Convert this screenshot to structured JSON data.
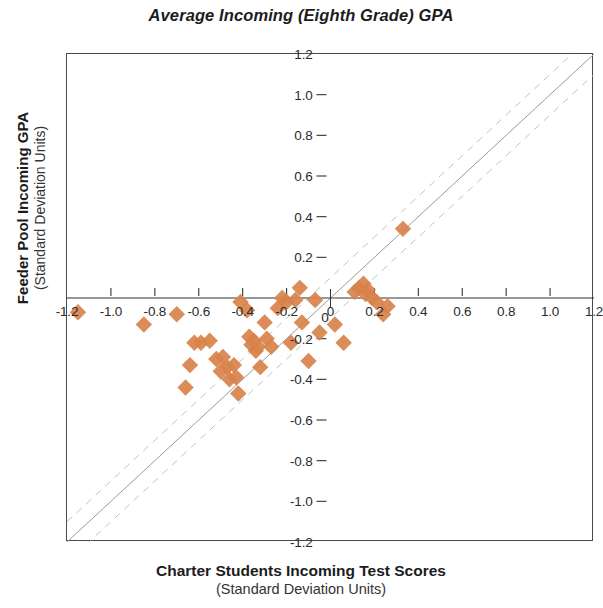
{
  "title": "Average Incoming (Eighth Grade) GPA",
  "axes": {
    "y_label_main": "Feeder Pool Incoming GPA",
    "y_label_sub": "(Standard Deviation Units)",
    "x_label_main": "Charter Students Incoming Test Scores",
    "x_label_sub": "(Standard Deviation Units)"
  },
  "style": {
    "marker_color": "#d8824a",
    "frame_color": "#4a4a4a",
    "reference_line_color": "#9a9a9a",
    "band_line_color": "#c2c2c2"
  },
  "chart_data": {
    "type": "scatter",
    "title": "Average Incoming (Eighth Grade) GPA",
    "xlabel": "Charter Students Incoming Test Scores (Standard Deviation Units)",
    "ylabel": "Feeder Pool Incoming GPA (Standard Deviation Units)",
    "xlim": [
      -1.2,
      1.2
    ],
    "ylim": [
      -1.2,
      1.2
    ],
    "xticks": [
      -1.2,
      -1.0,
      -0.8,
      -0.6,
      -0.4,
      -0.2,
      0,
      0.2,
      0.4,
      0.6,
      0.8,
      1.0,
      1.2
    ],
    "xtick_labels": [
      "-1.2",
      "-1.0",
      "-0.8",
      "-0.6",
      "-0.4",
      "-0.2",
      "0",
      "0.2",
      "0.4",
      "0.6",
      "0.8",
      "1.0",
      "1.2"
    ],
    "yticks": [
      1.2,
      1.0,
      0.8,
      0.6,
      0.4,
      0.2,
      0,
      -0.2,
      -0.4,
      -0.6,
      -0.8,
      -1.0,
      -1.2
    ],
    "ytick_labels": [
      "1.2",
      "1.0",
      "0.8",
      "0.6",
      "0.4",
      "0.2",
      "0",
      "-0.2",
      "-0.4",
      "-0.6",
      "-0.8",
      "-1.0",
      "-1.2"
    ],
    "grid": false,
    "legend": null,
    "axes_cross_at_origin": true,
    "marker": "diamond",
    "marker_color": "#d8824a",
    "reference_lines": [
      {
        "name": "identity",
        "style": "solid",
        "slope": 1,
        "intercept": 0
      },
      {
        "name": "upper-band",
        "style": "dashed",
        "slope": 1,
        "intercept": 0.1
      },
      {
        "name": "lower-band",
        "style": "dashed",
        "slope": 1,
        "intercept": -0.1
      }
    ],
    "points": [
      [
        -1.15,
        -0.07
      ],
      [
        -0.85,
        -0.13
      ],
      [
        -0.7,
        -0.08
      ],
      [
        -0.62,
        -0.22
      ],
      [
        -0.59,
        -0.22
      ],
      [
        -0.64,
        -0.33
      ],
      [
        -0.66,
        -0.44
      ],
      [
        -0.55,
        -0.21
      ],
      [
        -0.52,
        -0.3
      ],
      [
        -0.5,
        -0.36
      ],
      [
        -0.49,
        -0.29
      ],
      [
        -0.47,
        -0.34
      ],
      [
        -0.46,
        -0.4
      ],
      [
        -0.44,
        -0.33
      ],
      [
        -0.43,
        -0.39
      ],
      [
        -0.42,
        -0.47
      ],
      [
        -0.41,
        -0.02
      ],
      [
        -0.38,
        -0.06
      ],
      [
        -0.37,
        -0.19
      ],
      [
        -0.36,
        -0.23
      ],
      [
        -0.35,
        -0.21
      ],
      [
        -0.34,
        -0.26
      ],
      [
        -0.33,
        -0.24
      ],
      [
        -0.32,
        -0.34
      ],
      [
        -0.3,
        -0.12
      ],
      [
        -0.29,
        -0.2
      ],
      [
        -0.27,
        -0.24
      ],
      [
        -0.24,
        -0.05
      ],
      [
        -0.22,
        0.0
      ],
      [
        -0.2,
        -0.02
      ],
      [
        -0.18,
        -0.22
      ],
      [
        -0.16,
        -0.01
      ],
      [
        -0.14,
        0.05
      ],
      [
        -0.13,
        -0.12
      ],
      [
        -0.1,
        -0.31
      ],
      [
        -0.07,
        -0.01
      ],
      [
        -0.05,
        -0.17
      ],
      [
        0.02,
        -0.13
      ],
      [
        0.06,
        -0.22
      ],
      [
        0.11,
        0.03
      ],
      [
        0.13,
        0.05
      ],
      [
        0.15,
        0.07
      ],
      [
        0.16,
        0.02
      ],
      [
        0.17,
        0.04
      ],
      [
        0.19,
        0.0
      ],
      [
        0.21,
        -0.02
      ],
      [
        0.24,
        -0.08
      ],
      [
        0.26,
        -0.04
      ],
      [
        0.33,
        0.34
      ]
    ]
  }
}
